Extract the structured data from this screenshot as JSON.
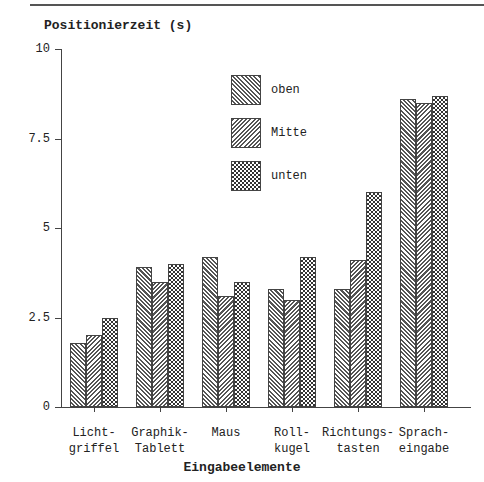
{
  "chart_data": {
    "type": "bar",
    "title": "",
    "ylabel": "Positionierzeit (s)",
    "xlabel": "Eingabeelemente",
    "ylim": [
      0,
      10
    ],
    "yticks": [
      "0",
      "2.5",
      "5",
      "7.5",
      "10"
    ],
    "grid": false,
    "legend_position": "inside-top-center",
    "categories": [
      "Licht-\ngriffel",
      "Graphik-\nTablett",
      "Maus",
      "Roll-\nkugel",
      "Richtungs-\ntasten",
      "Sprach-\neingabe"
    ],
    "series": [
      {
        "name": "oben",
        "pattern": "diagonal-right",
        "values": [
          1.8,
          3.9,
          4.2,
          3.3,
          3.3,
          8.6
        ]
      },
      {
        "name": "Mitte",
        "pattern": "diagonal-left",
        "values": [
          2.0,
          3.5,
          3.1,
          3.0,
          4.1,
          8.5
        ]
      },
      {
        "name": "unten",
        "pattern": "checker",
        "values": [
          2.5,
          4.0,
          3.5,
          4.2,
          6.0,
          8.7
        ]
      }
    ]
  }
}
